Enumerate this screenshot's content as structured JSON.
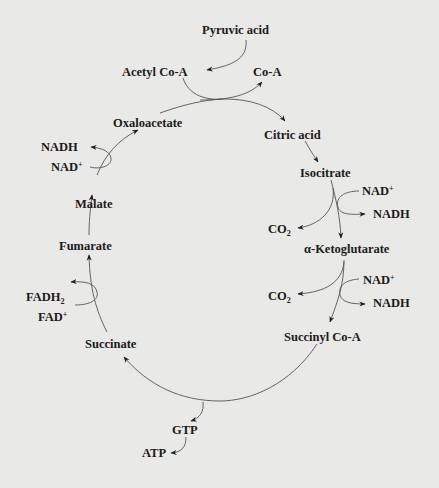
{
  "diagram": {
    "colors": {
      "background": "#e9e9e7",
      "ink": "#1b1b1b",
      "line": "#555555"
    },
    "entry": {
      "pyruvic_acid": "Pyruvic acid",
      "acetyl_coa": "Acetyl Co-A",
      "coa_released": "Co-A"
    },
    "intermediates": {
      "citric_acid": "Citric acid",
      "isocitrate": "Isocitrate",
      "alpha_ketoglutarate": "α-Ketoglutarate",
      "succinyl_coa": "Succinyl Co-A",
      "succinate": "Succinate",
      "fumarate": "Fumarate",
      "malate": "Malate",
      "oxaloacetate": "Oxaloacetate"
    },
    "side_reactions": {
      "isocitrate_step": {
        "nad_in": "NAD",
        "nad_in_sup": "+",
        "nadh_out": "NADH",
        "co2": "CO",
        "co2_sub": "2"
      },
      "ketoglutarate_step": {
        "nad_in": "NAD",
        "nad_in_sup": "+",
        "nadh_out": "NADH",
        "co2": "CO",
        "co2_sub": "2"
      },
      "succinyl_step": {
        "gtp": "GTP",
        "atp": "ATP"
      },
      "succinate_step": {
        "fad_in": "FAD",
        "fad_in_sup": "+",
        "fadh2_out": "FADH",
        "fadh2_sub": "2"
      },
      "malate_step": {
        "nad_in": "NAD",
        "nad_in_sup": "+",
        "nadh_out": "NADH"
      }
    }
  }
}
